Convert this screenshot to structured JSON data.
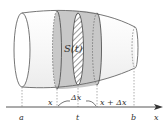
{
  "figure": {
    "colors": {
      "outline": "#555555",
      "slab_fill": "#c8c8c8",
      "body_fill": "#f4f4f4",
      "hatch": "#666666",
      "axis": "#444444"
    },
    "labels": {
      "section_area": "S(t)",
      "x_left": "x",
      "delta": "Δx",
      "x_right": "x + Δx",
      "a": "a",
      "t": "t",
      "b": "b",
      "axis": "x"
    }
  }
}
